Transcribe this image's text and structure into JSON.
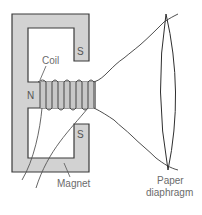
{
  "diagram": {
    "labels": {
      "coil": "Coil",
      "north_pole": "N",
      "south_pole_top": "S",
      "south_pole_bottom": "S",
      "magnet": "Magnet",
      "diaphragm_line1": "Paper",
      "diaphragm_line2": "diaphragm"
    },
    "colors": {
      "magnet_fill": "#d2d2d2",
      "outline": "#3a3a3a",
      "coil_wire": "#444444",
      "label_text": "#6b6b6b",
      "background": "#ffffff"
    },
    "components": [
      "magnet",
      "coil",
      "paper-diaphragm",
      "lead-wires"
    ]
  }
}
